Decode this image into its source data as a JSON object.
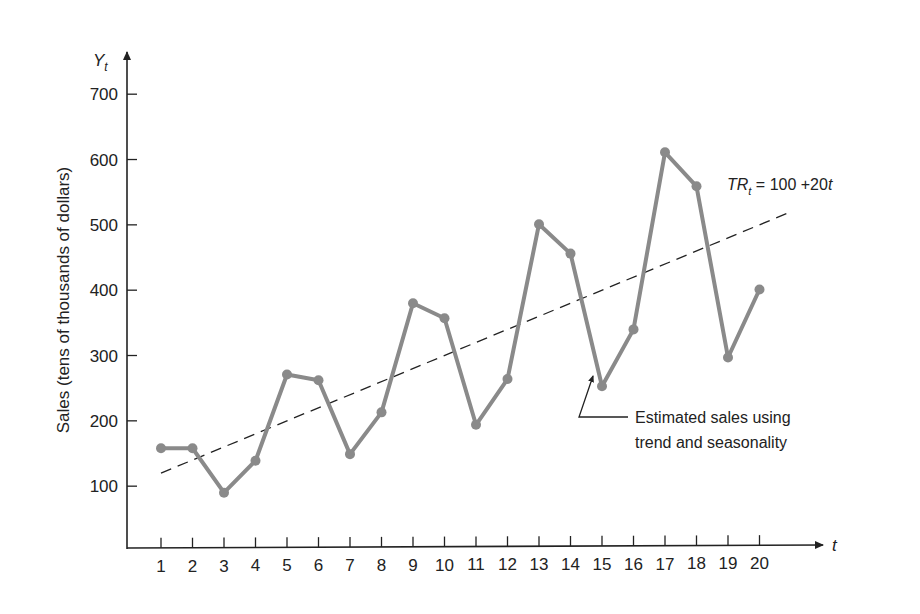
{
  "chart_data": {
    "type": "line",
    "title": "",
    "xlabel": "t",
    "ylabel": "Sales (tens of thousands of dollars)",
    "y_axis_symbol": "Y",
    "y_axis_symbol_sub": "t",
    "x": [
      1,
      2,
      3,
      4,
      5,
      6,
      7,
      8,
      9,
      10,
      11,
      12,
      13,
      14,
      15,
      16,
      17,
      18,
      19,
      20
    ],
    "ylim": [
      0,
      750
    ],
    "yticks": [
      100,
      200,
      300,
      400,
      500,
      600,
      700
    ],
    "xticks": [
      1,
      2,
      3,
      4,
      5,
      6,
      7,
      8,
      9,
      10,
      11,
      12,
      13,
      14,
      15,
      16,
      17,
      18,
      19,
      20
    ],
    "grid": false,
    "series": [
      {
        "name": "Estimated sales using trend and seasonality",
        "style": "solid gray with markers",
        "color": "#8a8a8a",
        "values": [
          158,
          158,
          90,
          139,
          271,
          262,
          149,
          213,
          380,
          357,
          194,
          264,
          501,
          456,
          253,
          340,
          611,
          559,
          297,
          401
        ]
      },
      {
        "name": "Trend line",
        "style": "dashed black",
        "color": "#222222",
        "equation": "TR_t = 100 + 20t",
        "x_range": [
          1,
          21
        ],
        "values_at_endpoints": [
          120,
          520
        ]
      }
    ],
    "annotations": [
      {
        "text_line1": "Estimated sales using",
        "text_line2": "trend and seasonality",
        "points_to": "sales line near t=15"
      },
      {
        "label_main": "TR",
        "label_sub": "t",
        "label_rest": " = 100 +20",
        "label_var": "t"
      }
    ]
  }
}
